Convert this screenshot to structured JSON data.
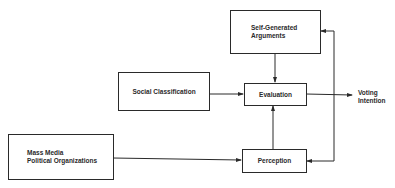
{
  "diagram": {
    "nodes": {
      "self_generated_arguments": {
        "lines": [
          "Self-Generated",
          "Arguments"
        ]
      },
      "social_classification": {
        "label": "Social Classification"
      },
      "evaluation": {
        "label": "Evaluation"
      },
      "mass_media": {
        "lines": [
          "Mass Media",
          "Political Organizations"
        ]
      },
      "perception": {
        "label": "Perception"
      }
    },
    "output": {
      "lines": [
        "Voting",
        "Intention"
      ]
    },
    "edges": [
      {
        "from": "Self-Generated Arguments",
        "to": "Evaluation"
      },
      {
        "from": "Social Classification",
        "to": "Evaluation"
      },
      {
        "from": "Perception",
        "to": "Evaluation"
      },
      {
        "from": "Mass Media / Political Organizations",
        "to": "Perception"
      },
      {
        "from": "Evaluation",
        "to": "Voting Intention"
      },
      {
        "from": "Voting Intention (feedback)",
        "to": "Self-Generated Arguments"
      },
      {
        "from": "Voting Intention (feedback)",
        "to": "Perception"
      }
    ]
  }
}
